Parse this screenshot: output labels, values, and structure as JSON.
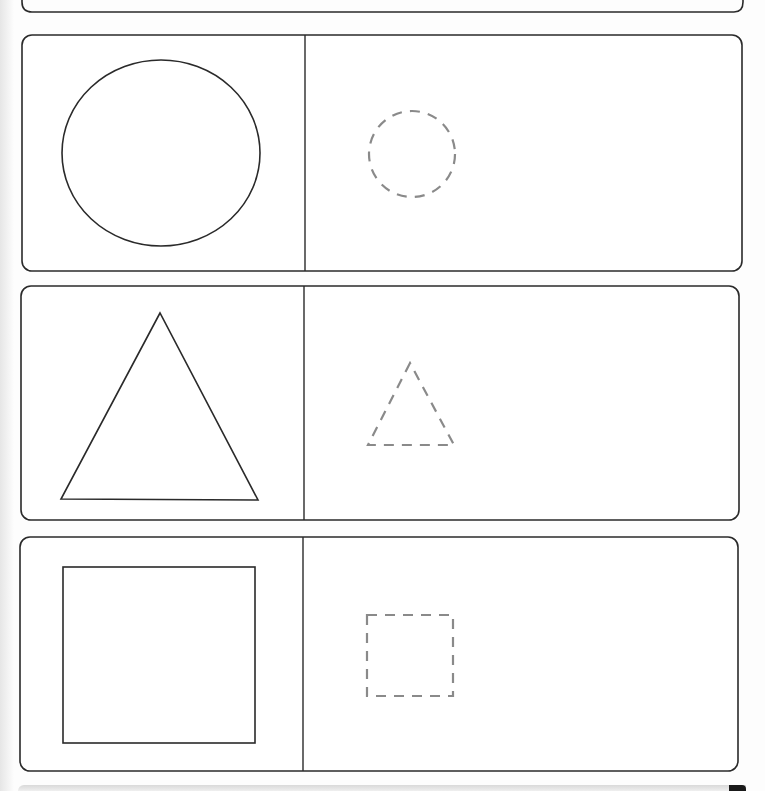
{
  "worksheet": {
    "title": "",
    "activity": "trace-shapes",
    "rows": [
      {
        "shape": "circle",
        "example_style": "solid",
        "trace_style": "dashed"
      },
      {
        "shape": "triangle",
        "example_style": "solid",
        "trace_style": "dashed"
      },
      {
        "shape": "square",
        "example_style": "solid",
        "trace_style": "dashed"
      }
    ],
    "colors": {
      "outline": "#2a2a2a",
      "dashed": "#8a8a8a",
      "paper": "#fdfdfd"
    }
  }
}
